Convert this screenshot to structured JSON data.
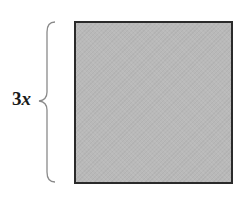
{
  "diagram": {
    "label": {
      "coefficient": "3",
      "variable": "x"
    },
    "shape": "square",
    "brace": "left-curly-brace",
    "colors": {
      "fill": "#b9b9b9",
      "stroke": "#2a2a2a",
      "brace": "#8a8a8a",
      "text": "#1a1a1a"
    }
  }
}
